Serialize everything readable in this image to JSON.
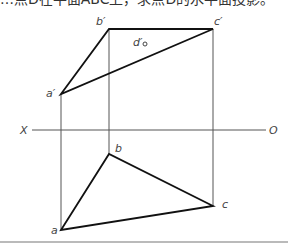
{
  "caption": {
    "text": "…点D在平面ABC上，求点D的水平面投影。"
  },
  "labels": {
    "a_prime": "a′",
    "b_prime": "b′",
    "c_prime": "c′",
    "d_prime": "d′",
    "a": "a",
    "b": "b",
    "c": "c",
    "axis_left": "X",
    "axis_right": "O"
  },
  "points": {
    "a_prime": [
      61,
      94
    ],
    "b_prime": [
      109,
      29
    ],
    "c_prime": [
      213,
      29
    ],
    "d_prime": [
      145,
      44
    ],
    "a": [
      61,
      230
    ],
    "b": [
      109,
      154
    ],
    "c": [
      213,
      206
    ]
  },
  "axis": {
    "y": 130,
    "x_start": 32,
    "x_end": 266
  }
}
